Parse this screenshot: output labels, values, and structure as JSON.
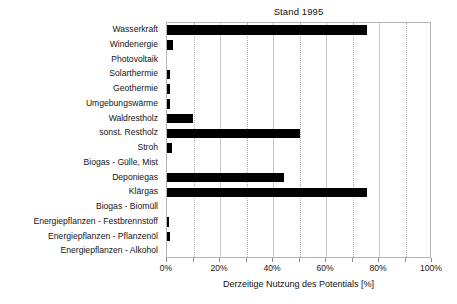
{
  "chart_data": {
    "type": "bar",
    "orientation": "horizontal",
    "title": "Stand 1995",
    "xlabel": "Derzeitige Nutzung des Potentials [%]",
    "ylabel": "",
    "xlim": [
      0,
      100
    ],
    "xtick_labels": [
      "0%",
      "20%",
      "40%",
      "60%",
      "80%",
      "100%"
    ],
    "xtick_values": [
      0,
      20,
      40,
      60,
      80,
      100
    ],
    "minor_tick_values": [
      10,
      30,
      50,
      70,
      90
    ],
    "grid": "vertical gridlines: solid at 20% steps, dotted at 10% offsets",
    "legend": "none",
    "bar_color": "#000000",
    "categories": [
      "Wasserkraft",
      "Windenergie",
      "Photovoltaik",
      "Solarthermie",
      "Geothermie",
      "Umgebungswärme",
      "Waldrestholz",
      "sonst. Restholz",
      "Stroh",
      "Biogas - Gülle, Mist",
      "Deponiegas",
      "Klärgas",
      "Biogas - Biomüll",
      "Energiepflanzen - Festbrennstoff",
      "Energiepflanzen - Pflanzenöl",
      "Energiepflanzen - Alkohol"
    ],
    "values": [
      75.5,
      2.2,
      0.0,
      1.0,
      1.2,
      1.2,
      9.8,
      50.0,
      2.0,
      0.0,
      44.0,
      75.3,
      0.0,
      0.8,
      1.3,
      0.0
    ]
  }
}
